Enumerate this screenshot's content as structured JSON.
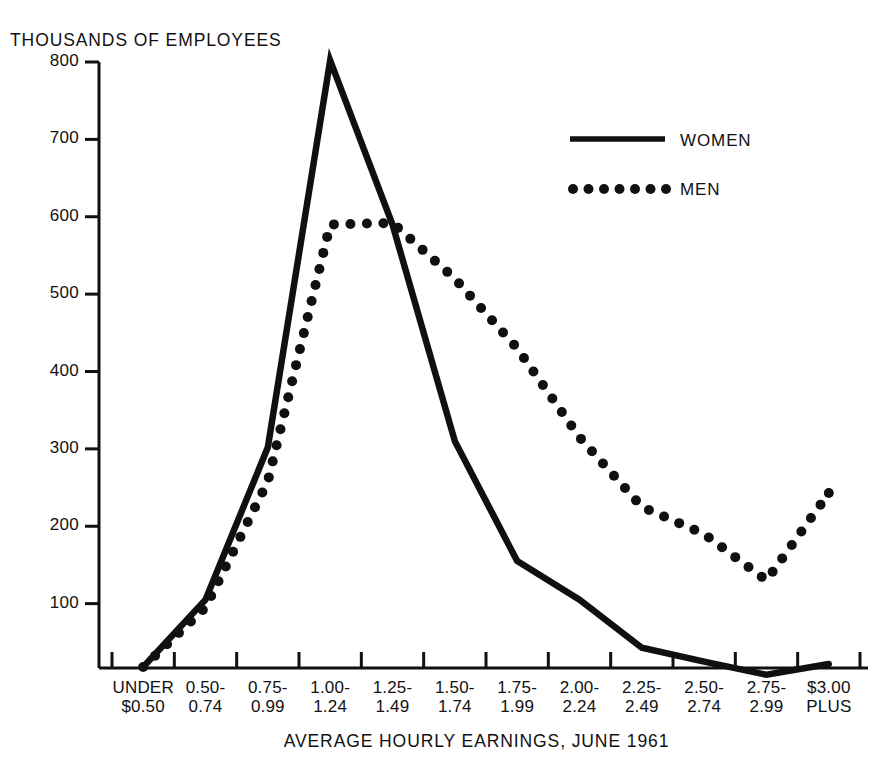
{
  "chart_data": {
    "type": "line",
    "title": "",
    "ylabel": "THOUSANDS OF EMPLOYEES",
    "xlabel": "AVERAGE HOURLY EARNINGS, JUNE 1961",
    "categories": [
      "UNDER\n$0.50",
      "0.50-\n0.74",
      "0.75-\n0.99",
      "1.00-\n1.24",
      "1.25-\n1.49",
      "1.50-\n1.74",
      "1.75-\n1.99",
      "2.00-\n2.24",
      "2.25-\n2.49",
      "2.50-\n2.74",
      "2.75-\n2.99",
      "$3.00\nPLUS"
    ],
    "categories_lines": [
      [
        "UNDER",
        "$0.50"
      ],
      [
        "0.50-",
        "0.74"
      ],
      [
        "0.75-",
        "0.99"
      ],
      [
        "1.00-",
        "1.24"
      ],
      [
        "1.25-",
        "1.49"
      ],
      [
        "1.50-",
        "1.74"
      ],
      [
        "1.75-",
        "1.99"
      ],
      [
        "2.00-",
        "2.24"
      ],
      [
        "2.25-",
        "2.49"
      ],
      [
        "2.50-",
        "2.74"
      ],
      [
        "2.75-",
        "2.99"
      ],
      [
        "$3.00",
        "PLUS"
      ]
    ],
    "yticks": [
      100,
      200,
      300,
      400,
      500,
      600,
      700,
      800
    ],
    "ytick_labels": [
      "100",
      "200",
      "300",
      "400",
      "500",
      "600",
      "700",
      "800"
    ],
    "ylim": [
      0,
      800
    ],
    "grid": false,
    "legend_position": "upper-right",
    "series": [
      {
        "name": "WOMEN",
        "style": "solid",
        "color": "#101010",
        "values": [
          18,
          105,
          302,
          802,
          590,
          310,
          155,
          105,
          43,
          25,
          8,
          22
        ]
      },
      {
        "name": "MEN",
        "style": "dotted",
        "color": "#101010",
        "values": [
          18,
          95,
          258,
          590,
          592,
          520,
          430,
          315,
          225,
          190,
          130,
          243
        ]
      }
    ]
  },
  "legend": {
    "items": [
      {
        "label": "WOMEN",
        "style": "solid"
      },
      {
        "label": "MEN",
        "style": "dotted"
      }
    ]
  }
}
